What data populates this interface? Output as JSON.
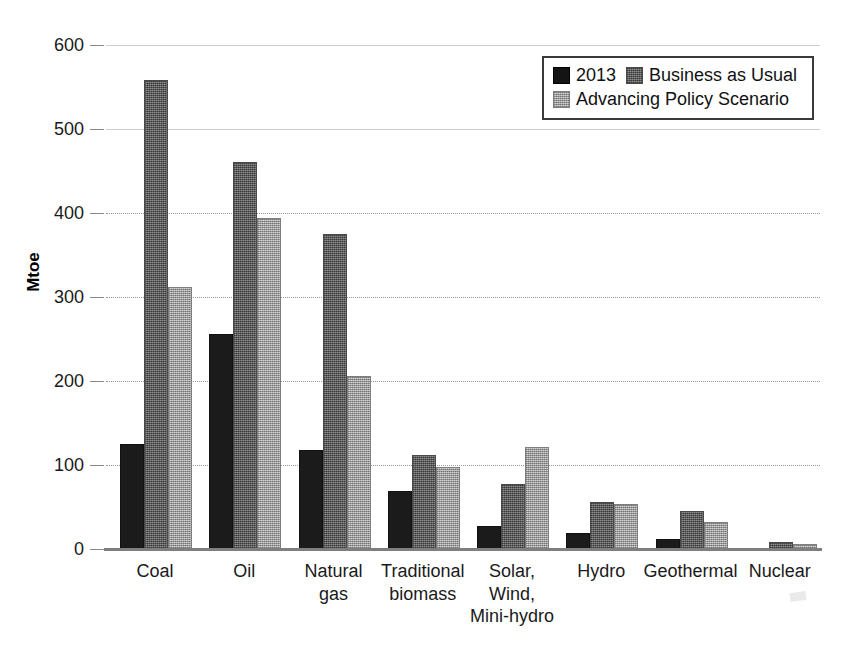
{
  "chart_data": {
    "type": "bar",
    "title": "",
    "xlabel": "",
    "ylabel": "Mtoe",
    "ylim": [
      0,
      600
    ],
    "ytick_step": 100,
    "yticks": [
      "0",
      "100",
      "200",
      "300",
      "400",
      "500",
      "600"
    ],
    "grid": true,
    "grid_axis": "y",
    "legend_position": "top-right",
    "categories": [
      "Coal",
      "Oil",
      "Natural\ngas",
      "Traditional\nbiomass",
      "Solar,\nWind,\nMini-hydro",
      "Hydro",
      "Geothermal",
      "Nuclear"
    ],
    "series": [
      {
        "name": "2013",
        "color": "#141414",
        "values": [
          123,
          254,
          115,
          67,
          25,
          17,
          9,
          0
        ]
      },
      {
        "name": "Business as Usual",
        "color": "#6e6e6e",
        "values": [
          556,
          458,
          373,
          110,
          75,
          54,
          43,
          6
        ]
      },
      {
        "name": "Advancing Policy Scenario",
        "color": "#a8a8a8",
        "values": [
          310,
          392,
          203,
          95,
          119,
          51,
          30,
          3
        ]
      }
    ]
  },
  "legend": {
    "rows": [
      [
        {
          "label": "2013",
          "series": 0
        },
        {
          "label": "Business as Usual",
          "series": 1
        }
      ],
      [
        {
          "label": "Advancing Policy Scenario",
          "series": 2
        }
      ]
    ]
  }
}
